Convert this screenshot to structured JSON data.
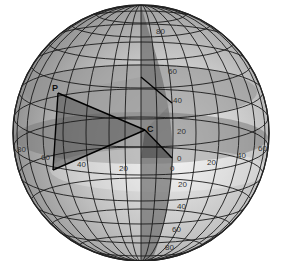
{
  "diagram": {
    "type": "globe-latitude-longitude",
    "points": {
      "P": "P",
      "C": "C"
    },
    "latitude_labels_north": [
      "80",
      "60",
      "40",
      "20",
      "0"
    ],
    "latitude_labels_south": [
      "20",
      "40",
      "60",
      "80"
    ],
    "longitude_labels_west": [
      "80",
      "60",
      "40",
      "20",
      "0"
    ],
    "longitude_labels_east": [
      "20",
      "40",
      "60"
    ],
    "colors": {
      "background": "#ffffff",
      "sphere_light": "#e6e6e6",
      "sphere_mid": "#b9b9b9",
      "sphere_dark": "#8a8a8a",
      "meridian_band": "#7d7d7d",
      "triangle": "#6f6f6f",
      "grid_line": "#1a1a1a"
    }
  }
}
